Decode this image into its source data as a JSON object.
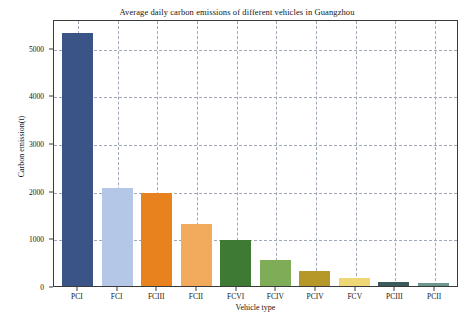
{
  "chart_data": {
    "type": "bar",
    "title": "Average daily carbon emissions of different vehicles in Guangzhou",
    "xlabel": "Vehicle type",
    "ylabel": "Carbon emission(t)",
    "categories": [
      "PCI",
      "FCI",
      "FCIII",
      "FCII",
      "FCVI",
      "FCIV",
      "PCIV",
      "FCV",
      "PCIII",
      "PCII"
    ],
    "values": [
      5300,
      2060,
      1950,
      1300,
      960,
      550,
      310,
      165,
      75,
      55
    ],
    "colors": [
      "#3b5488",
      "#b4c7e7",
      "#e8821e",
      "#f2aa5c",
      "#3e7a33",
      "#7fac56",
      "#b59827",
      "#f0d775",
      "#3d5a5a",
      "#6d9590"
    ],
    "ylim": [
      0,
      5600
    ],
    "yticks": [
      0,
      1000,
      2000,
      3000,
      4000,
      5000
    ],
    "ytick_labels": [
      "0",
      "1000",
      "2000",
      "3000",
      "4000",
      "5000"
    ],
    "grid": "dashed-both",
    "legend": "none"
  }
}
